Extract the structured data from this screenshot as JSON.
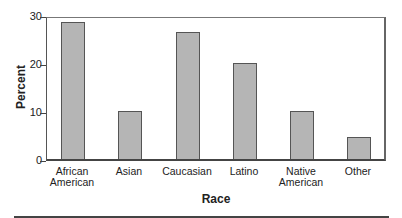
{
  "chart_data": {
    "type": "bar",
    "title": "",
    "xlabel": "Race",
    "ylabel": "Percent",
    "ylim": [
      0,
      30
    ],
    "yticks": [
      0,
      10,
      20,
      30
    ],
    "grid": false,
    "categories": [
      "African American",
      "Asian",
      "Caucasian",
      "Latino",
      "Native American",
      "Other"
    ],
    "category_lines": [
      [
        "African",
        "American"
      ],
      [
        "Asian"
      ],
      [
        "Caucasian"
      ],
      [
        "Latino"
      ],
      [
        "Native",
        "American"
      ],
      [
        "Other"
      ]
    ],
    "values": [
      28.5,
      10,
      26.5,
      20,
      10,
      4.5
    ],
    "bar_color": "#b5b5b5"
  }
}
